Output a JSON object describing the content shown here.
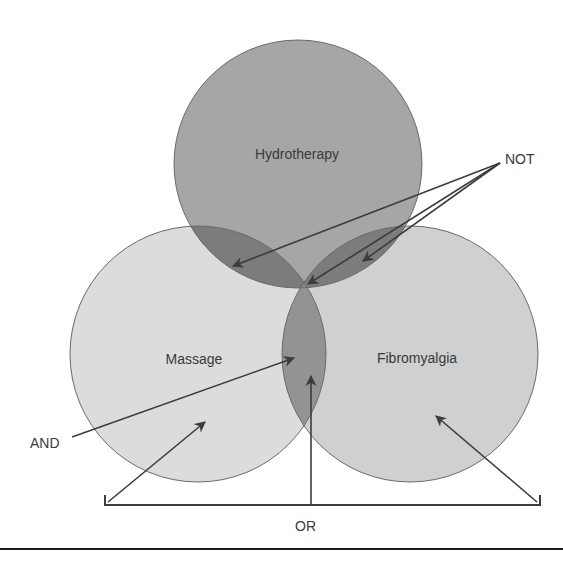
{
  "diagram": {
    "type": "venn",
    "sets": [
      {
        "id": "hydrotherapy",
        "label": "Hydrotherapy",
        "fill": "#a6a6a6"
      },
      {
        "id": "massage",
        "label": "Massage",
        "fill": "#dcdcdc"
      },
      {
        "id": "fibromyalgia",
        "label": "Fibromyalgia",
        "fill": "#d0d0d0"
      }
    ],
    "overlap_fills": {
      "hydro_massage": "#7c7c7c",
      "hydro_fibro": "#7c7c7c",
      "massage_fibro": "#939393",
      "outline": "#6a6a6a"
    },
    "annotations": [
      {
        "id": "not",
        "label": "NOT",
        "points_to": [
          "Hydrotherapy ∩ Massage",
          "Hydrotherapy ∩ Fibromyalgia",
          "center intersection"
        ]
      },
      {
        "id": "and",
        "label": "AND",
        "points_to": [
          "Massage ∩ Fibromyalgia"
        ]
      },
      {
        "id": "or",
        "label": "OR",
        "points_to": [
          "Massage",
          "Massage ∩ Fibromyalgia",
          "Fibromyalgia"
        ]
      }
    ],
    "arrow_color": "#3c3c3c"
  }
}
